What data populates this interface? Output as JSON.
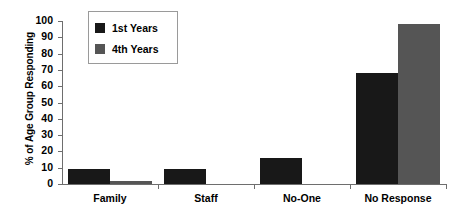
{
  "chart_data": {
    "type": "bar",
    "title": "",
    "subtitle": "",
    "xlabel": "",
    "ylabel": "% of Age Group Responding",
    "categories": [
      "Family",
      "Staff",
      "No-One",
      "No Response"
    ],
    "series": [
      {
        "name": "1st Years",
        "color": "#181818",
        "values": [
          9,
          9,
          16,
          68
        ]
      },
      {
        "name": "4th Years",
        "color": "#555555",
        "values": [
          2,
          0,
          0,
          98
        ]
      }
    ],
    "ylim": [
      0,
      100
    ],
    "ytick_step": 10,
    "ytick_labels": [
      "100",
      "90",
      "80",
      "70",
      "60",
      "50",
      "40",
      "30",
      "20",
      "10",
      "0"
    ],
    "grid": false,
    "legend_position": "top-left-inset",
    "legend_entries": [
      "1st Years",
      "4th Years"
    ]
  }
}
